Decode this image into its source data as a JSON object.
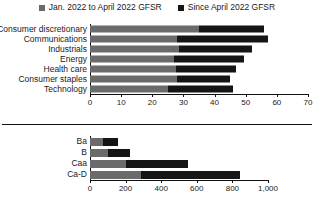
{
  "legend": {
    "items": [
      {
        "label": "Jan. 2022 to April 2022 GFSR",
        "color": "#6b6b6b",
        "icon": "square-swatch-icon"
      },
      {
        "label": "Since April 2022 GFSR",
        "color": "#151515",
        "icon": "square-swatch-icon"
      }
    ]
  },
  "chart_data": [
    {
      "type": "bar",
      "orientation": "horizontal",
      "stacked": true,
      "title": "",
      "xlabel": "",
      "ylabel": "",
      "xlim": [
        0,
        70
      ],
      "xticks": [
        0,
        10,
        20,
        30,
        40,
        50,
        60,
        70
      ],
      "xticklabels": [
        "0",
        "10",
        "20",
        "30",
        "40",
        "50",
        "60",
        "70"
      ],
      "grid": false,
      "legend_position": "top-center",
      "categories": [
        "Consumer discretionary",
        "Communications",
        "Industrials",
        "Energy",
        "Health care",
        "Consumer staples",
        "Technology"
      ],
      "series": [
        {
          "name": "Jan. 2022 to April 2022 GFSR",
          "color": "#6b6b6b",
          "values": [
            35,
            28,
            28.5,
            27,
            27.5,
            28,
            25
          ]
        },
        {
          "name": "Since April 2022 GFSR",
          "color": "#151515",
          "values": [
            21,
            29,
            23.5,
            22.5,
            19.5,
            17,
            21
          ]
        }
      ],
      "totals": [
        56,
        57,
        52,
        49.5,
        47,
        45,
        46
      ]
    },
    {
      "type": "bar",
      "orientation": "horizontal",
      "stacked": true,
      "title": "",
      "xlabel": "",
      "ylabel": "",
      "xlim": [
        0,
        1000
      ],
      "xticks": [
        0,
        200,
        400,
        600,
        800,
        1000
      ],
      "xticklabels": [
        "0",
        "200",
        "400",
        "600",
        "800",
        "1,000"
      ],
      "grid": false,
      "legend_position": "shared-top",
      "categories": [
        "Ba",
        "B",
        "Caa",
        "Ca-D"
      ],
      "series": [
        {
          "name": "Jan. 2022 to April 2022 GFSR",
          "color": "#6b6b6b",
          "values": [
            73,
            100,
            200,
            285
          ]
        },
        {
          "name": "Since April 2022 GFSR",
          "color": "#151515",
          "values": [
            85,
            125,
            350,
            560
          ]
        }
      ],
      "totals": [
        158,
        225,
        550,
        845
      ]
    }
  ]
}
